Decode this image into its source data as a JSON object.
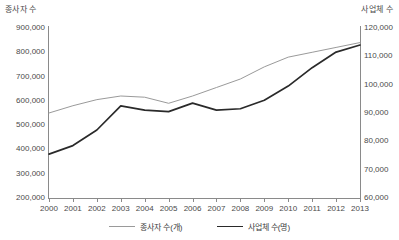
{
  "chart_data": {
    "type": "line",
    "title": "",
    "xlabel": "",
    "ylabel": "종사자 수",
    "y2label": "사업체 수",
    "grid": false,
    "legend_position": "bottom-center",
    "categories": [
      "2000",
      "2001",
      "2002",
      "2003",
      "2004",
      "2005",
      "2006",
      "2007",
      "2008",
      "2009",
      "2010",
      "2011",
      "2012",
      "2013"
    ],
    "x": [
      2000,
      2001,
      2002,
      2003,
      2004,
      2005,
      2006,
      2007,
      2008,
      2009,
      2010,
      2011,
      2012,
      2013
    ],
    "yticks_left": [
      "200,000",
      "300,000",
      "400,000",
      "500,000",
      "600,000",
      "700,000",
      "800,000",
      "900,000"
    ],
    "yticks_right": [
      "60,000",
      "70,000",
      "80,000",
      "90,000",
      "100,000",
      "110,000",
      "120,000"
    ],
    "ylim_left": [
      200000,
      900000
    ],
    "ylim_right": [
      60000,
      120000
    ],
    "series": [
      {
        "name": "종사자 수(개)",
        "axis": "left",
        "color": "#9a9a9a",
        "values": [
          550000,
          580000,
          605000,
          620000,
          615000,
          590000,
          620000,
          655000,
          690000,
          740000,
          780000,
          800000,
          820000,
          840000
        ]
      },
      {
        "name": "사업체 수(명)",
        "axis": "right",
        "color": "#2a2a2a",
        "values": [
          75500,
          78500,
          84000,
          92500,
          91000,
          90500,
          93500,
          91000,
          91500,
          94500,
          99500,
          106000,
          111500,
          114000
        ]
      }
    ],
    "legend": [
      {
        "label": "종사자 수(개)",
        "color": "#9a9a9a",
        "style": "thin"
      },
      {
        "label": "사업체 수(명)",
        "color": "#2a2a2a",
        "style": "thick"
      }
    ]
  },
  "axes": {
    "left_title": "종사자 수",
    "right_title": "사업체 수"
  }
}
